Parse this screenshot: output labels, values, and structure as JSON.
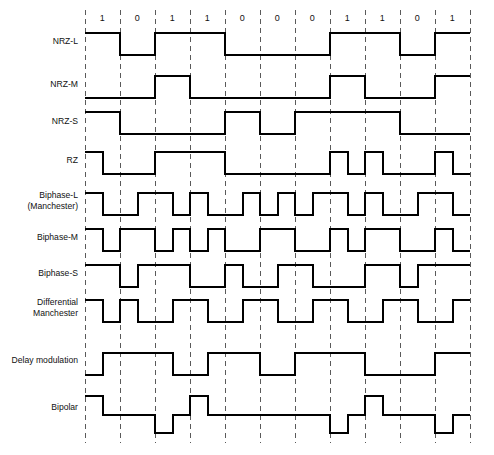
{
  "figure": {
    "bit_sequence": [
      "1",
      "0",
      "1",
      "1",
      "0",
      "0",
      "0",
      "1",
      "1",
      "0",
      "1"
    ],
    "bit_count": 11,
    "colors": {
      "waveform": "#000000",
      "gridline": "#5a5a5a",
      "text": "#111111",
      "background": "#ffffff"
    },
    "layout": {
      "width": 494,
      "height": 455,
      "grid_x_start": 85,
      "bit_width": 35,
      "grid_y_top": 10,
      "grid_y_bottom": 443,
      "label_x": 78,
      "bit_label_y": 21
    },
    "rows": [
      {
        "name": "nrz-l",
        "label": "NRZ-L",
        "label_lines": [
          "NRZ-L"
        ],
        "label_y": 44,
        "baseline_y": 55,
        "high_y": 33,
        "low_y": 55,
        "levels": [
          1,
          0,
          1,
          1,
          0,
          0,
          0,
          1,
          1,
          0,
          1
        ],
        "segments_per_bit": 1
      },
      {
        "name": "nrz-m",
        "label": "NRZ-M",
        "label_lines": [
          "NRZ-M"
        ],
        "label_y": 87,
        "baseline_y": 98,
        "high_y": 76,
        "low_y": 98,
        "levels": [
          0,
          0,
          1,
          0,
          0,
          0,
          0,
          1,
          0,
          0,
          1
        ],
        "segments_per_bit": 1
      },
      {
        "name": "nrz-s",
        "label": "NRZ-S",
        "label_lines": [
          "NRZ-S"
        ],
        "label_y": 124,
        "baseline_y": 134,
        "high_y": 112,
        "low_y": 134,
        "levels": [
          1,
          0,
          0,
          0,
          1,
          0,
          1,
          1,
          1,
          0,
          0
        ],
        "segments_per_bit": 1
      },
      {
        "name": "rz",
        "label": "RZ",
        "label_lines": [
          "RZ"
        ],
        "label_y": 163,
        "baseline_y": 174,
        "high_y": 152,
        "low_y": 174,
        "levels": [
          1,
          0,
          0,
          0,
          1,
          1,
          1,
          1,
          0,
          0,
          0,
          0,
          0,
          0,
          1,
          0,
          1,
          0,
          0,
          0,
          1,
          0
        ],
        "segments_per_bit": 2
      },
      {
        "name": "biphase-l-manchester",
        "label": "Biphase-L (Manchester)",
        "label_lines": [
          "Biphase-L",
          "(Manchester)"
        ],
        "label_y": 198,
        "baseline_y": 215,
        "high_y": 193,
        "low_y": 215,
        "levels": [
          1,
          0,
          0,
          1,
          1,
          0,
          1,
          0,
          0,
          1,
          0,
          1,
          0,
          1,
          1,
          0,
          1,
          0,
          0,
          1,
          1,
          0
        ],
        "segments_per_bit": 2
      },
      {
        "name": "biphase-m",
        "label": "Biphase-M",
        "label_lines": [
          "Biphase-M"
        ],
        "label_y": 240,
        "baseline_y": 251,
        "high_y": 229,
        "low_y": 251,
        "levels": [
          1,
          0,
          1,
          1,
          0,
          1,
          0,
          1,
          0,
          0,
          1,
          1,
          0,
          0,
          1,
          0,
          1,
          1,
          0,
          0,
          1,
          0
        ],
        "segments_per_bit": 2
      },
      {
        "name": "biphase-s",
        "label": "Biphase-S",
        "label_lines": [
          "Biphase-S"
        ],
        "label_y": 276,
        "baseline_y": 287,
        "high_y": 265,
        "low_y": 287,
        "levels": [
          1,
          1,
          0,
          1,
          1,
          1,
          0,
          0,
          1,
          0,
          0,
          1,
          1,
          0,
          0,
          0,
          1,
          1,
          0,
          1,
          1,
          1
        ],
        "segments_per_bit": 2
      },
      {
        "name": "differential-manchester",
        "label": "Differential Manchester",
        "label_lines": [
          "Differential",
          "Manchester"
        ],
        "label_y": 305,
        "baseline_y": 322,
        "high_y": 300,
        "low_y": 322,
        "levels": [
          1,
          0,
          1,
          0,
          0,
          1,
          1,
          0,
          0,
          1,
          1,
          0,
          0,
          1,
          1,
          0,
          0,
          1,
          1,
          0,
          0,
          1
        ],
        "segments_per_bit": 2
      },
      {
        "name": "delay-modulation",
        "label": "Delay modulation",
        "label_lines": [
          "Delay modulation"
        ],
        "label_y": 363,
        "baseline_y": 375,
        "high_y": 353,
        "low_y": 375,
        "levels": [
          0,
          1,
          1,
          1,
          1,
          0,
          0,
          1,
          1,
          1,
          0,
          0,
          1,
          1,
          1,
          1,
          0,
          0,
          0,
          0,
          1,
          1
        ],
        "segments_per_bit": 2
      },
      {
        "name": "bipolar",
        "label": "Bipolar",
        "label_lines": [
          "Bipolar"
        ],
        "label_y": 410,
        "baseline_y": 415,
        "high_y": 396,
        "low_y": 433,
        "levels": [
          1,
          0,
          0,
          0,
          -1,
          0,
          1,
          0,
          0,
          0,
          0,
          0,
          0,
          0,
          -1,
          0,
          1,
          0,
          0,
          0,
          -1,
          0
        ],
        "segments_per_bit": 2,
        "bipolar": true,
        "pulse_polarity": [
          1,
          0,
          -1,
          1,
          0,
          0,
          0,
          -1,
          1,
          0,
          -1
        ]
      }
    ]
  }
}
